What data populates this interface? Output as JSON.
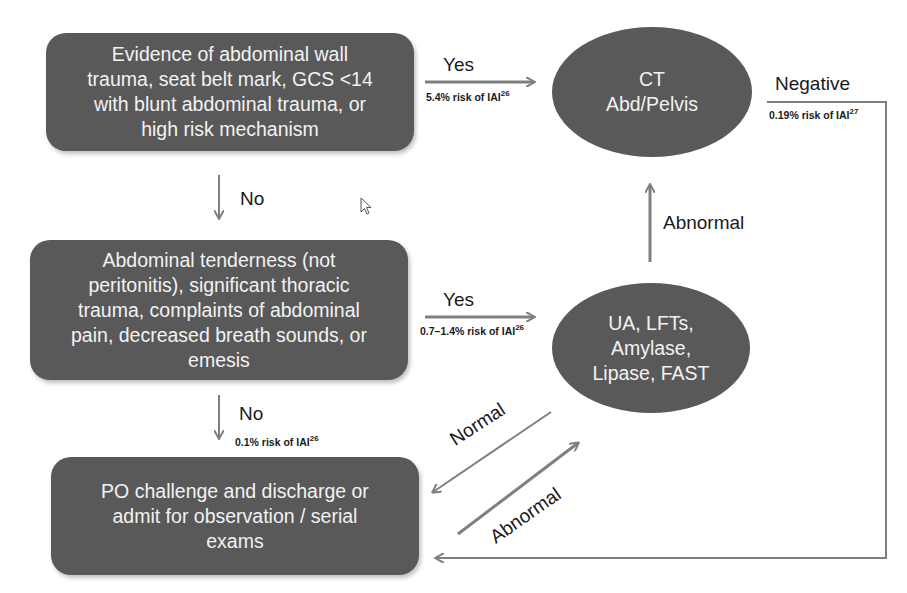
{
  "nodes": {
    "box1": {
      "text": "Evidence of abdominal wall trauma, seat belt mark, GCS <14 with blunt abdominal trauma, or high risk mechanism",
      "lines": [
        "Evidence of abdominal wall",
        "trauma, seat belt mark, GCS <14",
        "with blunt abdominal trauma, or",
        "high risk mechanism"
      ]
    },
    "box2": {
      "lines": [
        "Abdominal tenderness (not",
        "peritonitis), significant thoracic",
        "trauma, complaints of abdominal",
        "pain, decreased breath sounds, or",
        "emesis"
      ]
    },
    "box3": {
      "lines": [
        "PO challenge and discharge or",
        "admit for observation / serial",
        "exams"
      ]
    },
    "ct": {
      "lines": [
        "CT",
        "Abd/Pelvis"
      ]
    },
    "labs": {
      "lines": [
        "UA, LFTs,",
        "Amylase,",
        "Lipase, FAST"
      ]
    }
  },
  "edges": {
    "yes1": {
      "label": "Yes",
      "risk": "5.4% risk of IAI",
      "ref": "26"
    },
    "no1": {
      "label": "No"
    },
    "yes2": {
      "label": "Yes",
      "risk": "0.7–1.4% risk of IAI",
      "ref": "26"
    },
    "no2": {
      "label": "No",
      "risk": "0.1% risk of IAI",
      "ref": "26"
    },
    "abnormal_up": {
      "label": "Abnormal"
    },
    "negative": {
      "label": "Negative",
      "risk": "0.19% risk of IAI",
      "ref": "27"
    },
    "normal": {
      "label": "Normal"
    },
    "abnormal_diag": {
      "label": "Abnormal"
    }
  },
  "colors": {
    "node_fill": "#595959",
    "node_text": "#f2f2f2",
    "arrow": "#7f7f7f"
  }
}
